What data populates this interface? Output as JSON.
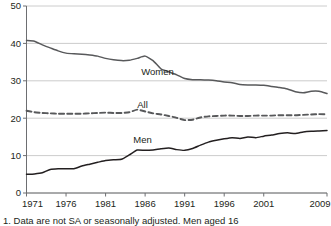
{
  "chart_data": {
    "type": "line",
    "title": "",
    "subtitle": "",
    "xlabel": "",
    "ylabel": "",
    "xlim": [
      1971,
      2009
    ],
    "ylim": [
      0,
      50
    ],
    "grid": true,
    "legend_position": "inline-labels",
    "y_ticks": [
      "0",
      "10",
      "20",
      "30",
      "40",
      "50"
    ],
    "y_tick_values": [
      0,
      10,
      20,
      30,
      40,
      50
    ],
    "x_ticks": [
      "1971",
      "1976",
      "1981",
      "1986",
      "1991",
      "1996",
      "2001",
      "2009"
    ],
    "x_tick_values": [
      1971,
      1976,
      1981,
      1986,
      1991,
      1996,
      2001,
      2009
    ],
    "x": [
      1971,
      1972,
      1973,
      1974,
      1975,
      1976,
      1977,
      1978,
      1979,
      1980,
      1981,
      1982,
      1983,
      1984,
      1985,
      1986,
      1987,
      1988,
      1989,
      1990,
      1991,
      1992,
      1993,
      1994,
      1995,
      1996,
      1997,
      1998,
      1999,
      2000,
      2001,
      2002,
      2003,
      2004,
      2005,
      2006,
      2007,
      2008,
      2009
    ],
    "series": [
      {
        "name": "Women",
        "style": "solid",
        "color": "#58595b",
        "label": "Women",
        "label_x": 1985.5,
        "label_y": 31.5,
        "values": [
          40.8,
          40.6,
          39.6,
          38.8,
          38.0,
          37.4,
          37.2,
          37.1,
          36.9,
          36.6,
          36.0,
          35.6,
          35.4,
          35.5,
          36.0,
          36.6,
          35.4,
          33.2,
          32.4,
          31.6,
          30.6,
          30.3,
          30.3,
          30.2,
          30.0,
          29.7,
          29.5,
          29.0,
          28.9,
          28.9,
          28.8,
          28.5,
          28.2,
          27.8,
          27.1,
          26.8,
          27.2,
          27.2,
          26.6
        ]
      },
      {
        "name": "All",
        "style": "dashed",
        "color": "#58595b",
        "label": "All",
        "label_x": 1985.0,
        "label_y": 22.6,
        "values": [
          22.0,
          21.6,
          21.4,
          21.3,
          21.2,
          21.2,
          21.2,
          21.2,
          21.3,
          21.4,
          21.5,
          21.4,
          21.4,
          21.6,
          22.3,
          21.8,
          21.3,
          21.0,
          20.6,
          20.1,
          19.5,
          19.6,
          20.2,
          20.5,
          20.6,
          20.7,
          20.7,
          20.6,
          20.6,
          20.7,
          20.7,
          20.7,
          20.8,
          20.8,
          20.8,
          20.9,
          21.0,
          21.1,
          21.0
        ]
      },
      {
        "name": "Men",
        "style": "solid",
        "color": "#231f20",
        "label": "Men",
        "label_x": 1984.5,
        "label_y": 13.4,
        "values": [
          5.0,
          5.1,
          5.4,
          6.3,
          6.5,
          6.5,
          6.5,
          7.2,
          7.7,
          8.2,
          8.7,
          8.9,
          9.0,
          10.2,
          11.5,
          11.4,
          11.5,
          11.8,
          12.0,
          11.6,
          11.4,
          11.9,
          12.8,
          13.6,
          14.1,
          14.5,
          14.8,
          14.6,
          15.0,
          14.8,
          15.2,
          15.5,
          15.9,
          16.1,
          15.9,
          16.3,
          16.5,
          16.6,
          16.7
        ]
      }
    ],
    "caption": "1. Data are not SA or seasonally adjusted. Men aged 16"
  }
}
